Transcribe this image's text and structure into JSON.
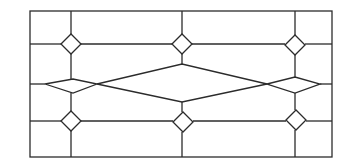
{
  "figure": {
    "stroke_color": "#2b2b2b",
    "background_color": "#ffffff",
    "frame": {
      "x": 30,
      "y": 11,
      "width": 302,
      "height": 146
    },
    "horizontal_lines": [
      {
        "y": 44,
        "segments": [
          [
            30,
            61
          ],
          [
            81,
            172
          ],
          [
            192,
            285
          ],
          [
            305,
            332
          ]
        ]
      },
      {
        "y": 84,
        "segments": [
          [
            30,
            45
          ],
          [
            320,
            332
          ]
        ]
      },
      {
        "y": 121,
        "segments": [
          [
            30,
            61
          ],
          [
            81,
            173
          ],
          [
            193,
            286
          ],
          [
            306,
            332
          ]
        ]
      }
    ],
    "vertical_lines": [
      {
        "x": 71,
        "segments": [
          [
            11,
            34
          ],
          [
            54,
            79
          ],
          [
            93,
            111
          ],
          [
            131,
            157
          ]
        ]
      },
      {
        "x": 182,
        "segments": [
          [
            11,
            34
          ],
          [
            54,
            64
          ],
          [
            102,
            112
          ],
          [
            132,
            157
          ]
        ]
      },
      {
        "x": 295,
        "segments": [
          [
            11,
            35
          ],
          [
            55,
            77
          ],
          [
            93,
            110
          ],
          [
            130,
            157
          ]
        ]
      }
    ],
    "small_diamonds": [
      {
        "name": "top-left",
        "cx": 71,
        "cy": 44,
        "rx": 10,
        "ry": 10
      },
      {
        "name": "top-center",
        "cx": 182,
        "cy": 44,
        "rx": 10,
        "ry": 10
      },
      {
        "name": "top-right",
        "cx": 295,
        "cy": 45,
        "rx": 10,
        "ry": 10
      },
      {
        "name": "bottom-left",
        "cx": 71,
        "cy": 121,
        "rx": 10,
        "ry": 10
      },
      {
        "name": "bottom-center",
        "cx": 183,
        "cy": 122,
        "rx": 10,
        "ry": 10
      },
      {
        "name": "bottom-right",
        "cx": 296,
        "cy": 120,
        "rx": 10,
        "ry": 10
      }
    ],
    "middle_band": {
      "left_diamond": [
        [
          45,
          84
        ],
        [
          73,
          79
        ],
        [
          97,
          84
        ],
        [
          73,
          93
        ]
      ],
      "center_diamond": [
        [
          97,
          84
        ],
        [
          182,
          64
        ],
        [
          267,
          84
        ],
        [
          182,
          102
        ]
      ],
      "right_diamond": [
        [
          267,
          84
        ],
        [
          295,
          77
        ],
        [
          320,
          84
        ],
        [
          295,
          93
        ]
      ]
    }
  }
}
